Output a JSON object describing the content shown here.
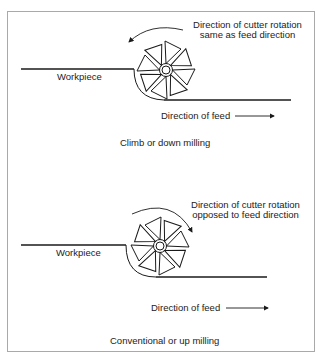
{
  "figure": {
    "panels": [
      {
        "id": "climb",
        "rotation_label_line1": "Direction of cutter rotation",
        "rotation_label_line2": "same as feed direction",
        "workpiece_label": "Workpiece",
        "feed_label": "Direction of feed",
        "caption": "Climb or down milling",
        "rotation_direction": "counterclockwise-arrow"
      },
      {
        "id": "conventional",
        "rotation_label_line1": "Direction of cutter rotation",
        "rotation_label_line2": "opposed to feed direction",
        "workpiece_label": "Workpiece",
        "feed_label": "Direction of feed",
        "caption": "Conventional or up milling",
        "rotation_direction": "clockwise-arrow"
      }
    ],
    "colors": {
      "line": "#1a1a1a",
      "border": "#a9a9a9",
      "background": "#ffffff"
    }
  }
}
